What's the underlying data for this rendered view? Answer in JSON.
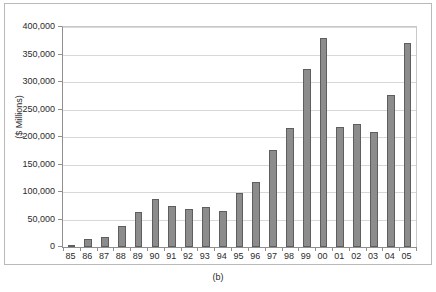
{
  "figure": {
    "caption": "(b)"
  },
  "chart_data": {
    "type": "bar",
    "title": "",
    "subtitle": "",
    "xlabel": "",
    "ylabel": "($ Millions)",
    "categories": [
      "85",
      "86",
      "87",
      "88",
      "89",
      "90",
      "91",
      "92",
      "93",
      "94",
      "95",
      "96",
      "97",
      "98",
      "99",
      "00",
      "01",
      "02",
      "03",
      "04",
      "05"
    ],
    "values": [
      4000,
      14000,
      19000,
      38000,
      64000,
      88000,
      75000,
      70000,
      73000,
      66000,
      98000,
      118000,
      177000,
      217000,
      324000,
      380000,
      218000,
      223000,
      210000,
      277000,
      371000
    ],
    "ylim": [
      0,
      400000
    ],
    "ytick_labels": [
      "0",
      "50,000",
      "100,000",
      "150,000",
      "200,000",
      "250,000",
      "300,000",
      "350,000",
      "400,000"
    ],
    "ytick_values": [
      0,
      50000,
      100000,
      150000,
      200000,
      250000,
      300000,
      350000,
      400000
    ],
    "grid": true,
    "legend": null,
    "legend_position": "none",
    "series": [
      {
        "name": "",
        "color": "#8c8c8c",
        "border_color": "#5e5e5e",
        "values": [
          4000,
          14000,
          19000,
          38000,
          64000,
          88000,
          75000,
          70000,
          73000,
          66000,
          98000,
          118000,
          177000,
          217000,
          324000,
          380000,
          218000,
          223000,
          210000,
          277000,
          371000
        ]
      }
    ]
  },
  "colors": {
    "bar_fill": "#8c8c8c",
    "bar_border": "#5e5e5e",
    "gridline": "#d8d8d8",
    "axis": "#8f8f8f",
    "text": "#2b2b2b",
    "frame": "#b9b9b9",
    "background": "#ffffff"
  }
}
